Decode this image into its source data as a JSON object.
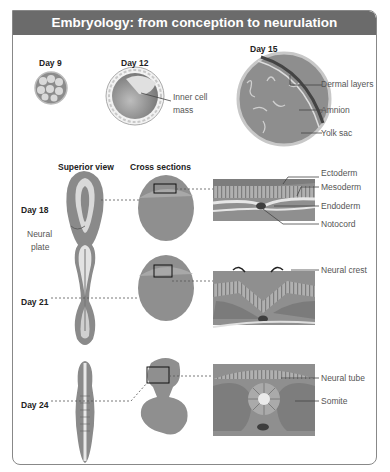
{
  "title": "Embryology: from conception to neurulation",
  "stages": {
    "day9": "Day 9",
    "day12": "Day 12",
    "day15": "Day 15",
    "day18": "Day 18",
    "day21": "Day 21",
    "day24": "Day 24"
  },
  "column_headers": {
    "superior": "Superior view",
    "cross": "Cross sections"
  },
  "labels": {
    "inner_cell_1": "Inner cell",
    "inner_cell_2": "mass",
    "dermal_layers": "Dermal layers",
    "amnion": "Amnion",
    "yolk_sac": "Yolk sac",
    "ectoderm": "Ectoderm",
    "mesoderm": "Mesoderm",
    "endoderm": "Endoderm",
    "notocord": "Notocord",
    "neural_plate_1": "Neural",
    "neural_plate_2": "plate",
    "neural_crest": "Neural crest",
    "neural_tube": "Neural tube",
    "somite": "Somite"
  },
  "colors": {
    "header_bg": "#6b6b6b",
    "tissue_dark": "#8a8a8a",
    "tissue_mid": "#a8a8a8",
    "tissue_light": "#d8d8d8",
    "border": "#888888"
  }
}
